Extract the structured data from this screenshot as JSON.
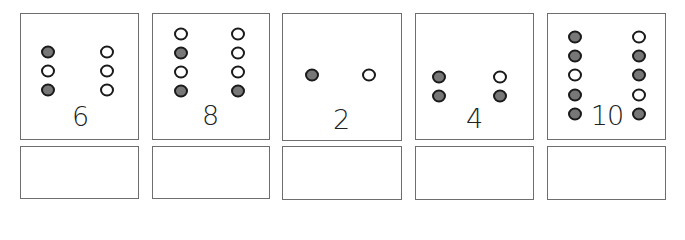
{
  "colors": {
    "border": "#6e6e6e",
    "dot_outline": "#1a1a1a",
    "dot_filled": "#777777",
    "dot_empty": "#ffffff"
  },
  "cards": [
    {
      "number": "6",
      "left_column": [
        "filled",
        "empty",
        "filled"
      ],
      "right_column": [
        "empty",
        "empty",
        "empty"
      ],
      "answer": ""
    },
    {
      "number": "8",
      "left_column": [
        "empty",
        "filled",
        "empty",
        "filled"
      ],
      "right_column": [
        "empty",
        "empty",
        "empty",
        "filled"
      ],
      "answer": ""
    },
    {
      "number": "2",
      "left_column": [
        "filled"
      ],
      "right_column": [
        "empty"
      ],
      "answer": ""
    },
    {
      "number": "4",
      "left_column": [
        "filled",
        "filled"
      ],
      "right_column": [
        "empty",
        "filled"
      ],
      "answer": ""
    },
    {
      "number": "10",
      "left_column": [
        "filled",
        "filled",
        "empty",
        "filled",
        "filled"
      ],
      "right_column": [
        "empty",
        "filled",
        "filled",
        "empty",
        "filled"
      ],
      "answer": ""
    }
  ]
}
